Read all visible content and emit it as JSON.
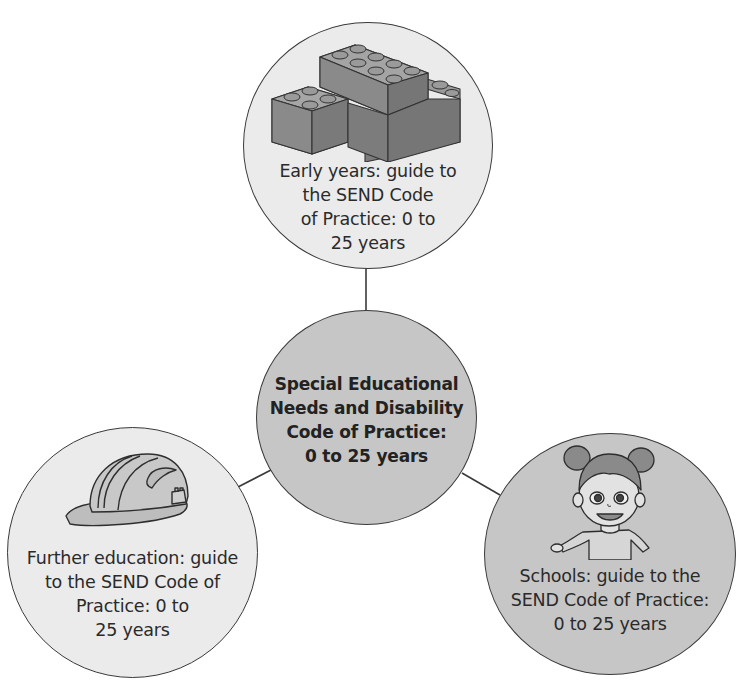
{
  "diagram": {
    "type": "hub-and-spoke",
    "colors": {
      "line": "#3a3a3a",
      "light_fill": "#ebebeb",
      "dark_fill": "#c6c6c6",
      "text": "#2a2a2a"
    },
    "center": {
      "lines": [
        "Special Educational",
        "Needs and Disability",
        "Code of Practice:",
        "0 to 25 years"
      ]
    },
    "nodes": {
      "early_years": {
        "icon": "lego-bricks-icon",
        "lines": [
          "Early years: guide to",
          "the SEND Code",
          "of Practice: 0 to",
          "25 years"
        ]
      },
      "further_education": {
        "icon": "hard-hat-icon",
        "lines": [
          "Further education: guide",
          "to the SEND Code of",
          "Practice: 0 to",
          "25 years"
        ]
      },
      "schools": {
        "icon": "schoolgirl-icon",
        "lines": [
          "Schools: guide to the",
          "SEND Code of Practice:",
          "0 to 25 years"
        ]
      }
    }
  }
}
